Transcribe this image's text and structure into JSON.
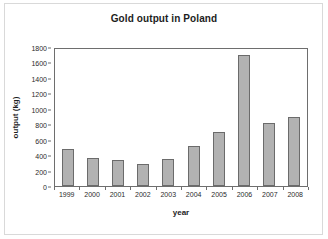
{
  "figure": {
    "title": "Gold output in Poland"
  },
  "chart_data": {
    "type": "bar",
    "title": "Gold output in Poland",
    "xlabel": "year",
    "ylabel": "output (kg)",
    "categories": [
      "1999",
      "2000",
      "2001",
      "2002",
      "2003",
      "2004",
      "2005",
      "2006",
      "2007",
      "2008"
    ],
    "values": [
      480,
      360,
      340,
      285,
      345,
      520,
      705,
      1700,
      820,
      890
    ],
    "ylim": [
      0,
      1800
    ],
    "ytick_labels": [
      "1800",
      "1600",
      "1400",
      "1200",
      "1000",
      "800",
      "600",
      "400",
      "200",
      "0"
    ],
    "ytick_values": [
      1800,
      1600,
      1400,
      1200,
      1000,
      800,
      600,
      400,
      200,
      0
    ],
    "ytick_step": 200,
    "grid": false,
    "legend": false,
    "bar_color": "#b2b2b2",
    "bar_border_color": "#6b6b6b",
    "axis_color": "#6e6e6e"
  }
}
